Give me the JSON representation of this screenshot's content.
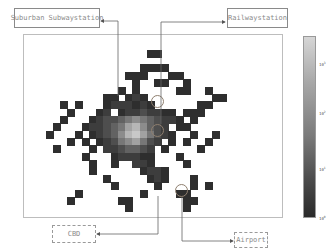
{
  "chart_data": {
    "type": "heatmap",
    "title": "",
    "xlabel": "",
    "ylabel": "",
    "grid": false,
    "colorbar": {
      "position": "right",
      "scale": "log",
      "colormap": "grayscale (dark = low, light = high)",
      "ticks": [
        "10^3",
        "10^2",
        "10^1",
        "10^0"
      ]
    },
    "grid_shape": {
      "cols": 36,
      "rows": 25
    },
    "cells": [
      [
        17,
        2,
        1
      ],
      [
        18,
        2,
        1
      ],
      [
        16,
        4,
        1
      ],
      [
        17,
        4,
        1
      ],
      [
        18,
        4,
        1
      ],
      [
        19,
        4,
        1
      ],
      [
        14,
        5,
        1
      ],
      [
        15,
        5,
        1
      ],
      [
        16,
        5,
        1
      ],
      [
        20,
        5,
        1
      ],
      [
        21,
        5,
        1
      ],
      [
        15,
        6,
        1
      ],
      [
        18,
        6,
        1
      ],
      [
        19,
        6,
        1
      ],
      [
        22,
        6,
        1
      ],
      [
        13,
        7,
        1
      ],
      [
        15,
        7,
        1
      ],
      [
        21,
        7,
        1
      ],
      [
        22,
        7,
        1
      ],
      [
        25,
        7,
        1
      ],
      [
        11,
        8,
        1
      ],
      [
        12,
        8,
        1
      ],
      [
        14,
        8,
        1
      ],
      [
        15,
        8,
        2
      ],
      [
        16,
        8,
        1
      ],
      [
        26,
        8,
        1
      ],
      [
        27,
        8,
        1
      ],
      [
        5,
        9,
        1
      ],
      [
        7,
        9,
        1
      ],
      [
        11,
        9,
        1
      ],
      [
        12,
        9,
        2
      ],
      [
        13,
        9,
        2
      ],
      [
        14,
        9,
        2
      ],
      [
        15,
        9,
        1
      ],
      [
        16,
        9,
        2
      ],
      [
        17,
        9,
        1
      ],
      [
        24,
        9,
        1
      ],
      [
        25,
        9,
        1
      ],
      [
        6,
        10,
        1
      ],
      [
        10,
        10,
        1
      ],
      [
        11,
        10,
        2
      ],
      [
        13,
        10,
        1
      ],
      [
        14,
        10,
        2
      ],
      [
        15,
        10,
        2
      ],
      [
        16,
        10,
        3
      ],
      [
        17,
        10,
        2
      ],
      [
        18,
        10,
        2
      ],
      [
        19,
        10,
        1
      ],
      [
        20,
        10,
        1
      ],
      [
        22,
        10,
        1
      ],
      [
        23,
        10,
        1
      ],
      [
        24,
        10,
        1
      ],
      [
        5,
        11,
        1
      ],
      [
        9,
        11,
        1
      ],
      [
        10,
        11,
        2
      ],
      [
        11,
        11,
        3
      ],
      [
        12,
        11,
        3
      ],
      [
        13,
        11,
        4
      ],
      [
        14,
        11,
        5
      ],
      [
        15,
        11,
        6
      ],
      [
        16,
        11,
        5
      ],
      [
        17,
        11,
        4
      ],
      [
        18,
        11,
        3
      ],
      [
        19,
        11,
        2
      ],
      [
        20,
        11,
        2
      ],
      [
        21,
        11,
        1
      ],
      [
        23,
        11,
        1
      ],
      [
        4,
        12,
        1
      ],
      [
        8,
        12,
        1
      ],
      [
        9,
        12,
        2
      ],
      [
        10,
        12,
        2
      ],
      [
        11,
        12,
        3
      ],
      [
        12,
        12,
        4
      ],
      [
        13,
        12,
        5
      ],
      [
        14,
        12,
        7
      ],
      [
        15,
        12,
        8
      ],
      [
        16,
        12,
        6
      ],
      [
        17,
        12,
        4
      ],
      [
        18,
        12,
        3
      ],
      [
        19,
        12,
        2
      ],
      [
        21,
        12,
        1
      ],
      [
        22,
        12,
        1
      ],
      [
        3,
        13,
        1
      ],
      [
        7,
        13,
        1
      ],
      [
        9,
        13,
        1
      ],
      [
        10,
        13,
        2
      ],
      [
        11,
        13,
        3
      ],
      [
        12,
        13,
        4
      ],
      [
        13,
        13,
        6
      ],
      [
        14,
        13,
        8
      ],
      [
        15,
        13,
        9
      ],
      [
        16,
        13,
        7
      ],
      [
        17,
        13,
        5
      ],
      [
        18,
        13,
        3
      ],
      [
        19,
        13,
        2
      ],
      [
        20,
        13,
        1
      ],
      [
        23,
        13,
        1
      ],
      [
        26,
        13,
        1
      ],
      [
        6,
        14,
        1
      ],
      [
        8,
        14,
        1
      ],
      [
        10,
        14,
        1
      ],
      [
        11,
        14,
        2
      ],
      [
        12,
        14,
        3
      ],
      [
        13,
        14,
        5
      ],
      [
        14,
        14,
        6
      ],
      [
        15,
        14,
        7
      ],
      [
        16,
        14,
        5
      ],
      [
        17,
        14,
        3
      ],
      [
        18,
        14,
        2
      ],
      [
        20,
        14,
        1
      ],
      [
        22,
        14,
        1
      ],
      [
        25,
        14,
        1
      ],
      [
        4,
        15,
        1
      ],
      [
        9,
        15,
        1
      ],
      [
        11,
        15,
        2
      ],
      [
        12,
        15,
        2
      ],
      [
        13,
        15,
        3
      ],
      [
        14,
        15,
        4
      ],
      [
        15,
        15,
        4
      ],
      [
        16,
        15,
        3
      ],
      [
        17,
        15,
        2
      ],
      [
        19,
        15,
        1
      ],
      [
        24,
        15,
        1
      ],
      [
        8,
        16,
        1
      ],
      [
        12,
        16,
        1
      ],
      [
        13,
        16,
        2
      ],
      [
        14,
        16,
        2
      ],
      [
        15,
        16,
        2
      ],
      [
        16,
        16,
        1
      ],
      [
        17,
        16,
        1
      ],
      [
        21,
        16,
        1
      ],
      [
        9,
        17,
        1
      ],
      [
        12,
        17,
        1
      ],
      [
        15,
        17,
        2
      ],
      [
        16,
        17,
        2
      ],
      [
        17,
        17,
        1
      ],
      [
        22,
        17,
        1
      ],
      [
        9,
        18,
        1
      ],
      [
        16,
        18,
        1
      ],
      [
        17,
        18,
        2
      ],
      [
        18,
        18,
        2
      ],
      [
        19,
        18,
        1
      ],
      [
        11,
        19,
        1
      ],
      [
        17,
        19,
        1
      ],
      [
        18,
        19,
        2
      ],
      [
        19,
        19,
        1
      ],
      [
        23,
        19,
        1
      ],
      [
        12,
        20,
        1
      ],
      [
        18,
        20,
        1
      ],
      [
        23,
        20,
        1
      ],
      [
        25,
        20,
        1
      ],
      [
        7,
        21,
        1
      ],
      [
        16,
        21,
        1
      ],
      [
        21,
        21,
        1
      ],
      [
        22,
        21,
        1
      ],
      [
        6,
        22,
        1
      ],
      [
        13,
        22,
        1
      ],
      [
        14,
        22,
        1
      ],
      [
        22,
        22,
        1
      ],
      [
        23,
        22,
        1
      ],
      [
        14,
        23,
        1
      ],
      [
        22,
        23,
        1
      ]
    ],
    "annotations": [
      {
        "text": "Suburban Subwaystation",
        "style": "solid box",
        "target": "upper central hotspot"
      },
      {
        "text": "Railwaystation",
        "style": "solid box",
        "target": "central hotspot"
      },
      {
        "text": "CBD",
        "style": "dashed box",
        "target": "central brightest region"
      },
      {
        "text": "Airport",
        "style": "dashed box",
        "target": "southeast tail"
      }
    ]
  },
  "labels": {
    "subway": "Suburban Subwaystation",
    "railway": "Railwaystation",
    "cbd": "CBD",
    "airport": "Airport"
  },
  "colorbar_ticks": [
    {
      "base": "10",
      "exp": "3"
    },
    {
      "base": "10",
      "exp": "2"
    },
    {
      "base": "10",
      "exp": "1"
    },
    {
      "base": "10",
      "exp": "0"
    }
  ]
}
